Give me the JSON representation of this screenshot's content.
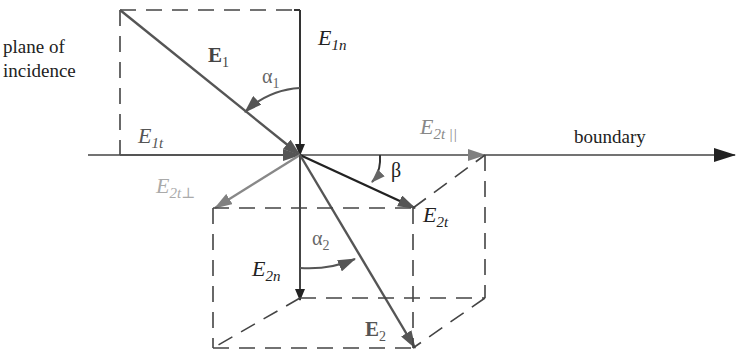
{
  "diagram": {
    "title_label_line1": "plane of",
    "title_label_line2": "incidence",
    "boundary_label": "boundary",
    "labels": {
      "E1": {
        "main": "E",
        "sub": "1"
      },
      "E1n": {
        "main": "E",
        "sub": "1n"
      },
      "E1t": {
        "main": "E",
        "sub": "1t"
      },
      "E2": {
        "main": "E",
        "sub": "2"
      },
      "E2n": {
        "main": "E",
        "sub": "2n"
      },
      "E2t": {
        "main": "E",
        "sub": "2t"
      },
      "E2t_par": {
        "main": "E",
        "sub": "2t ||"
      },
      "E2t_perp": {
        "main": "E",
        "sub": "2t⊥"
      },
      "alpha1": {
        "main": "α",
        "sub": "1"
      },
      "alpha2": {
        "main": "α",
        "sub": "2"
      },
      "beta": "β"
    },
    "colors": {
      "dark": "#2a2a2a",
      "medium": "#555555",
      "light": "#8a8a8a",
      "lighter": "#a8a8a8",
      "dashed": "#444444"
    }
  }
}
